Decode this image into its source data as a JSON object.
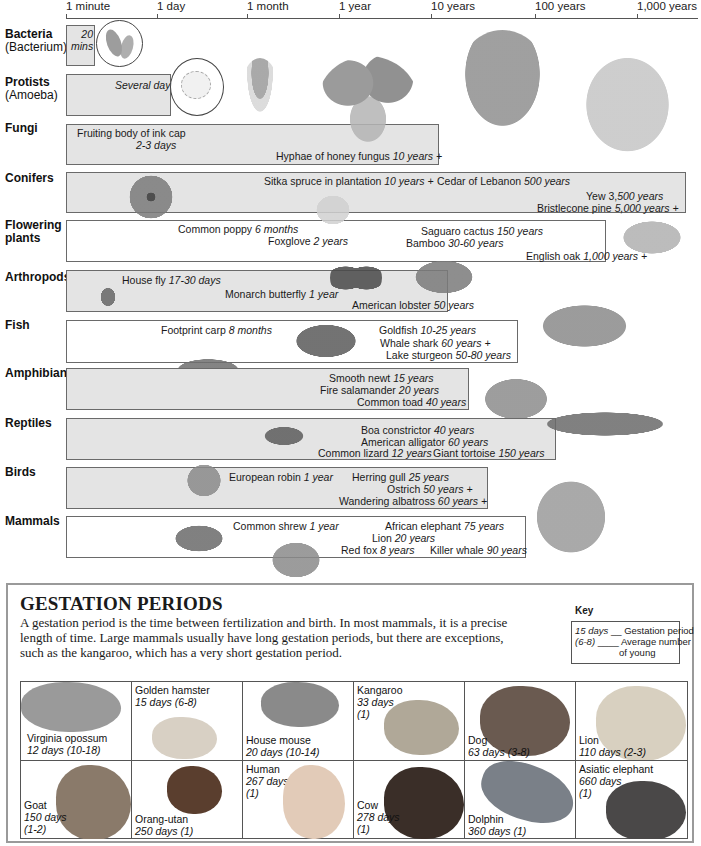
{
  "axis": {
    "ticks": [
      {
        "label": "1 minute",
        "x": 66
      },
      {
        "label": "1 day",
        "x": 157
      },
      {
        "label": "1 month",
        "x": 247
      },
      {
        "label": "1 year",
        "x": 339
      },
      {
        "label": "10 years",
        "x": 431
      },
      {
        "label": "100 years",
        "x": 535
      },
      {
        "label": "1,000 years",
        "x": 637
      }
    ]
  },
  "rows": [
    {
      "label": "Bacteria",
      "sublabel": "(Bacterium)"
    },
    {
      "label": "Protists",
      "sublabel": "(Amoeba)"
    },
    {
      "label": "Fungi"
    },
    {
      "label": "Conifers"
    },
    {
      "label": "Flowering plants"
    },
    {
      "label": "Arthropods"
    },
    {
      "label": "Fish"
    },
    {
      "label": "Amphibians"
    },
    {
      "label": "Reptiles"
    },
    {
      "label": "Birds"
    },
    {
      "label": "Mammals"
    }
  ],
  "bacteria": {
    "value_line1": "20",
    "value_line2": "mins"
  },
  "protists": {
    "value": "Several days"
  },
  "fungi": [
    {
      "name": "Fruiting body of ink cap",
      "value": "2-3 days"
    },
    {
      "name": "Hyphae of honey fungus",
      "value": "10 years +"
    }
  ],
  "conifers": [
    {
      "name": "Sitka spruce in plantation",
      "value": "10 years +"
    },
    {
      "name": "Cedar of Lebanon",
      "value": "500 years"
    },
    {
      "name": "Yew 3,",
      "value": "500 years"
    },
    {
      "name": "Bristlecone pine",
      "value": "5,000  years +"
    }
  ],
  "flowering": [
    {
      "name": "Common poppy",
      "value": "6 months"
    },
    {
      "name": "Foxglove",
      "value": "2 years"
    },
    {
      "name": "Saguaro cactus",
      "value": "150 years"
    },
    {
      "name": "Bamboo",
      "value": "30-60 years"
    },
    {
      "name": "English oak",
      "value": "1,000 years +"
    }
  ],
  "arthropods": [
    {
      "name": "House fly",
      "value": "17-30 days"
    },
    {
      "name": "Monarch butterfly",
      "value": "1 year"
    },
    {
      "name": "American lobster",
      "value": "50 years"
    }
  ],
  "fish": [
    {
      "name": "Footprint  carp",
      "value": "8 months"
    },
    {
      "name": "Goldfish",
      "value": "10-25 years"
    },
    {
      "name": "Whale shark",
      "value": "60 years +"
    },
    {
      "name": "Lake sturgeon",
      "value": "50-80 years"
    }
  ],
  "amphibians": [
    {
      "name": "Smooth newt",
      "value": "15 years"
    },
    {
      "name": "Fire salamander",
      "value": "20 years"
    },
    {
      "name": "Common toad",
      "value": "40 years"
    }
  ],
  "reptiles": [
    {
      "name": "Boa constrictor",
      "value": "40 years"
    },
    {
      "name": "American alligator",
      "value": "60 years"
    },
    {
      "name": "Common lizard",
      "value": "12 years"
    },
    {
      "name": "Giant tortoise",
      "value": "150 years"
    }
  ],
  "birds": [
    {
      "name": "European robin",
      "value": "1 year"
    },
    {
      "name": "Herring gull",
      "value": "25 years"
    },
    {
      "name": "Ostrich",
      "value": "50 years +"
    },
    {
      "name": "Wandering albatross",
      "value": "60 years +"
    }
  ],
  "mammals": [
    {
      "name": "Common shrew",
      "value": "1 year"
    },
    {
      "name": "African elephant",
      "value": "75 years"
    },
    {
      "name": "Lion",
      "value": "20 years"
    },
    {
      "name": "Red fox",
      "value": "8 years"
    },
    {
      "name": "Killer whale",
      "value": "90 years"
    }
  ],
  "gestation": {
    "title": "GESTATION PERIODS",
    "description": "A gestation period is the time between fertilization and birth. In most mammals, it is a precise length of time. Large mammals usually have long gestation periods, but there are exceptions, such as the kangaroo, which has a very short gestation period.",
    "key": {
      "title": "Key",
      "example_days": "15 days",
      "days_label": "Gestation period",
      "example_young": "(6-8)",
      "young_label_1": "Average number",
      "young_label_2": "of young"
    },
    "animals": [
      {
        "name": "Virginia opossum",
        "days": "12 days (10-18)"
      },
      {
        "name": "Golden hamster",
        "days": "15 days (6-8)"
      },
      {
        "name": "House mouse",
        "days": "20 days (10-14)"
      },
      {
        "name": "Kangaroo",
        "days": "33 days",
        "young": "(1)"
      },
      {
        "name": "Dog",
        "days": "63 days (3-8)"
      },
      {
        "name": "Lion",
        "days": "110 days (2-3)"
      },
      {
        "name": "Goat",
        "days": "150 days",
        "young": "(1-2)"
      },
      {
        "name": "Orang-utan",
        "days": "250 days (1)"
      },
      {
        "name": "Human",
        "days": "267 days",
        "young": "(1)"
      },
      {
        "name": "Cow",
        "days": "278 days",
        "young": "(1)"
      },
      {
        "name": "Dolphin",
        "days": "360 days (1)"
      },
      {
        "name": "Asiatic elephant",
        "days": "660 days",
        "young": "(1)"
      }
    ]
  },
  "colors": {
    "bar_border": "#6a6a6a",
    "bar_shaded": "#e4e4e4",
    "panel_border": "#9a9a9a"
  }
}
